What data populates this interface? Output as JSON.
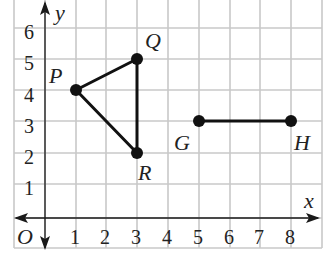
{
  "diagram": {
    "type": "coordinate-plane",
    "axes": {
      "x_label": "x",
      "y_label": "y",
      "origin_label": "O",
      "x_ticks": [
        "1",
        "2",
        "3",
        "4",
        "5",
        "6",
        "7",
        "8"
      ],
      "y_ticks": [
        "1",
        "2",
        "3",
        "4",
        "5",
        "6"
      ]
    },
    "points": [
      {
        "name": "P",
        "x": 1,
        "y": 4
      },
      {
        "name": "Q",
        "x": 3,
        "y": 5
      },
      {
        "name": "R",
        "x": 3,
        "y": 2
      },
      {
        "name": "G",
        "x": 5,
        "y": 3
      },
      {
        "name": "H",
        "x": 8,
        "y": 3
      }
    ],
    "segments": [
      [
        "P",
        "Q"
      ],
      [
        "Q",
        "R"
      ],
      [
        "R",
        "P"
      ],
      [
        "G",
        "H"
      ]
    ],
    "colors": {
      "grid": "#c8c8c8",
      "figure": "#111111"
    }
  }
}
